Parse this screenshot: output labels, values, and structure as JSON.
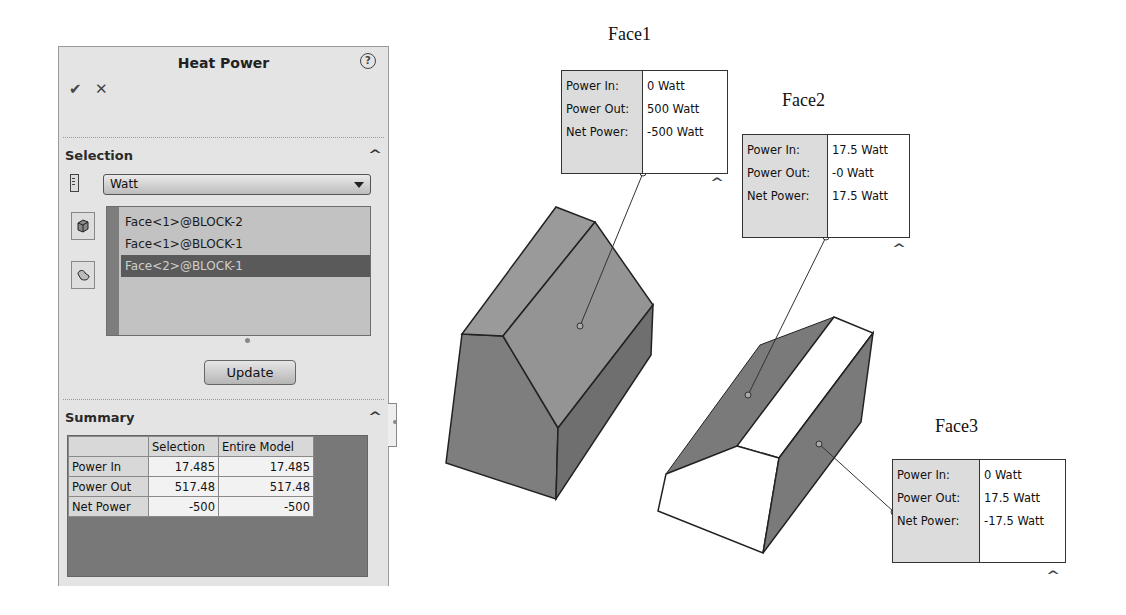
{
  "panel": {
    "title": "Heat Power",
    "help_icon": "?",
    "ok_icon": "✔",
    "cancel_icon": "✕",
    "selection": {
      "title": "Selection",
      "collapse_icon": "^",
      "unit": "Watt",
      "items": [
        {
          "label": "Face<1>@BLOCK-2",
          "selected": false
        },
        {
          "label": "Face<1>@BLOCK-1",
          "selected": false
        },
        {
          "label": "Face<2>@BLOCK-1",
          "selected": true
        }
      ],
      "update_label": "Update"
    },
    "summary": {
      "title": "Summary",
      "collapse_icon": "^",
      "columns": [
        "",
        "Selection",
        "Entire Model"
      ],
      "rows": [
        {
          "label": "Power In",
          "selection": "17.485",
          "entire": "17.485"
        },
        {
          "label": "Power Out",
          "selection": "517.48",
          "entire": "517.48"
        },
        {
          "label": "Net Power",
          "selection": "-500",
          "entire": "-500"
        }
      ]
    }
  },
  "callouts": [
    {
      "face": "Face1",
      "keys": [
        "Power In:",
        "Power Out:",
        "Net Power:"
      ],
      "values": [
        "0 Watt",
        "500 Watt",
        "-500 Watt"
      ],
      "caret": "^"
    },
    {
      "face": "Face2",
      "keys": [
        "Power In:",
        "Power Out:",
        "Net Power:"
      ],
      "values": [
        "17.5 Watt",
        "-0 Watt",
        "17.5 Watt"
      ],
      "caret": "^"
    },
    {
      "face": "Face3",
      "keys": [
        "Power In:",
        "Power Out:",
        "Net Power:"
      ],
      "values": [
        "0 Watt",
        "17.5 Watt",
        "-17.5 Watt"
      ],
      "caret": "^"
    }
  ],
  "colors": {
    "panel_bg": "#e4e4e4",
    "selected_row": "#5a5a5a",
    "face_dark": "#7a7a7a",
    "face_mid": "#939393",
    "face_white": "#ffffff"
  }
}
